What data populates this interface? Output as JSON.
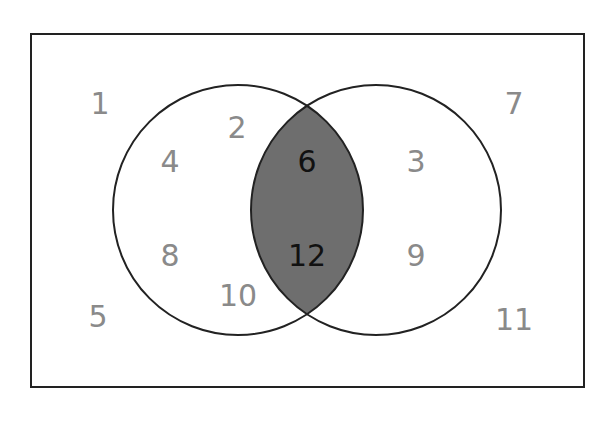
{
  "diagram": {
    "type": "venn",
    "universe": {
      "x": 31,
      "y": 34,
      "width": 553,
      "height": 353
    },
    "circles": [
      {
        "name": "left-set",
        "cx": 238,
        "cy": 210,
        "r": 125
      },
      {
        "name": "right-set",
        "cx": 376,
        "cy": 210,
        "r": 125
      }
    ],
    "colors": {
      "stroke": "#222222",
      "intersection_fill": "#6e6e6e",
      "label": "#8a8a8a",
      "intersection_label": "#111111"
    },
    "labels": {
      "outside": [
        {
          "value": "1",
          "x": 100,
          "y": 114
        },
        {
          "value": "5",
          "x": 98,
          "y": 327
        },
        {
          "value": "7",
          "x": 514,
          "y": 114
        },
        {
          "value": "11",
          "x": 514,
          "y": 330
        }
      ],
      "left_only": [
        {
          "value": "2",
          "x": 237,
          "y": 138
        },
        {
          "value": "4",
          "x": 170,
          "y": 172
        },
        {
          "value": "8",
          "x": 170,
          "y": 266
        },
        {
          "value": "10",
          "x": 238,
          "y": 306
        }
      ],
      "intersection": [
        {
          "value": "6",
          "x": 307,
          "y": 172
        },
        {
          "value": "12",
          "x": 307,
          "y": 266
        }
      ],
      "right_only": [
        {
          "value": "3",
          "x": 416,
          "y": 172
        },
        {
          "value": "9",
          "x": 416,
          "y": 266
        }
      ]
    }
  }
}
